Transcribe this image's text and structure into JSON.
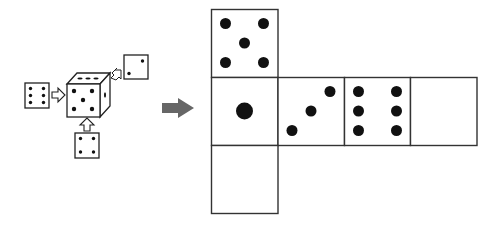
{
  "diagram": {
    "type": "dice-net-puzzle",
    "stroke_color": "#222222",
    "pip_color": "#111111",
    "arrow_color": "#666666",
    "cube": {
      "front_face": 5,
      "top_face": 3,
      "right_face": 1
    },
    "side_views": {
      "left": 6,
      "top_right": 2,
      "bottom": 4
    },
    "net": {
      "cells": [
        {
          "row": 0,
          "col": 0,
          "value": 5
        },
        {
          "row": 1,
          "col": 0,
          "value": 1
        },
        {
          "row": 1,
          "col": 1,
          "value": 3
        },
        {
          "row": 1,
          "col": 2,
          "value": 6
        },
        {
          "row": 1,
          "col": 3,
          "value": null
        },
        {
          "row": 2,
          "col": 0,
          "value": null
        }
      ]
    }
  }
}
